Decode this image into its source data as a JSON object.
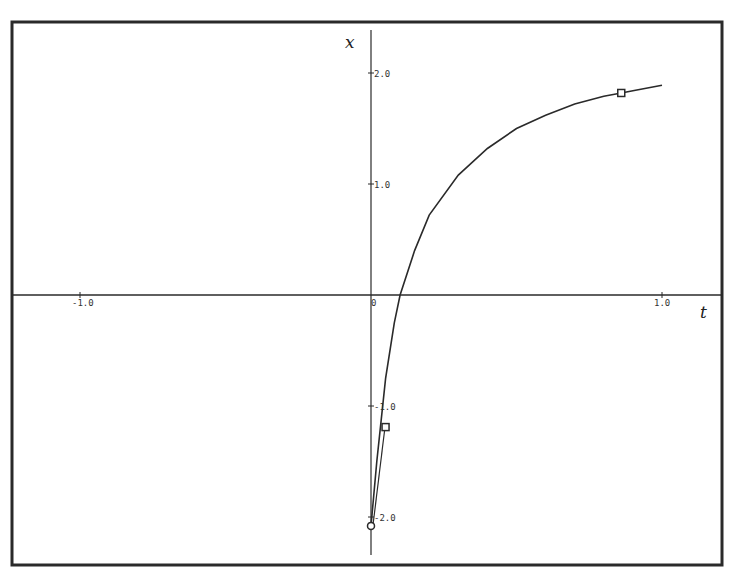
{
  "figure": {
    "frame": {
      "left": 12,
      "top": 22,
      "right": 722,
      "bottom": 565
    },
    "origin_px": {
      "x": 371,
      "y": 295
    },
    "px_per_unit_t": 291,
    "px_per_unit_x": 111,
    "ink_color": "#2a2a2a"
  },
  "chart_data": {
    "type": "line",
    "title": "",
    "xlabel": "t",
    "ylabel": "x",
    "xlim": [
      -1.22,
      1.2
    ],
    "ylim": [
      -2.4,
      2.5
    ],
    "grid": false,
    "x_ticks": [
      {
        "value": -1.0,
        "label": "-1.0"
      },
      {
        "value": 0,
        "label": "0"
      },
      {
        "value": 1.0,
        "label": "1.0"
      }
    ],
    "y_ticks": [
      {
        "value": 2.0,
        "label": "2.0"
      },
      {
        "value": 1.0,
        "label": "1.0"
      },
      {
        "value": -1.0,
        "label": "-1.0"
      },
      {
        "value": -2.0,
        "label": "-2.0"
      }
    ],
    "series": [
      {
        "name": "x(t)",
        "x": [
          0.0,
          0.02,
          0.05,
          0.08,
          0.1,
          0.15,
          0.2,
          0.3,
          0.4,
          0.5,
          0.6,
          0.7,
          0.8,
          0.86,
          0.9,
          1.0
        ],
        "values": [
          -2.08,
          -1.5,
          -0.75,
          -0.25,
          0.0,
          0.4,
          0.72,
          1.08,
          1.32,
          1.5,
          1.62,
          1.72,
          1.79,
          1.82,
          1.84,
          1.89
        ]
      }
    ],
    "markers": [
      {
        "shape": "circle",
        "t": 0.0,
        "x": -2.08
      },
      {
        "shape": "square",
        "t": 0.05,
        "x": -1.19
      },
      {
        "shape": "square",
        "t": 0.86,
        "x": 1.82
      }
    ],
    "annotations": []
  }
}
